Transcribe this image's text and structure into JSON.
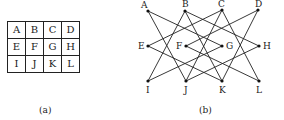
{
  "figure_a": {
    "caption": "(a)",
    "rows": [
      [
        "A",
        "B",
        "C",
        "D"
      ],
      [
        "E",
        "F",
        "G",
        "H"
      ],
      [
        "I",
        "J",
        "K",
        "L"
      ]
    ]
  },
  "figure_b": {
    "caption": "(b)",
    "nodes": {
      "A": {
        "x": 148,
        "y": 11,
        "lx": 141,
        "ly": 8
      },
      "B": {
        "x": 185,
        "y": 11,
        "lx": 182,
        "ly": 7
      },
      "C": {
        "x": 222,
        "y": 10,
        "lx": 218,
        "ly": 7
      },
      "D": {
        "x": 258,
        "y": 10,
        "lx": 255,
        "ly": 7
      },
      "E": {
        "x": 148,
        "y": 46,
        "lx": 138,
        "ly": 49
      },
      "F": {
        "x": 186,
        "y": 46,
        "lx": 176,
        "ly": 49
      },
      "G": {
        "x": 222,
        "y": 46,
        "lx": 226,
        "ly": 49
      },
      "H": {
        "x": 259,
        "y": 46,
        "lx": 263,
        "ly": 49
      },
      "I": {
        "x": 148,
        "y": 81,
        "lx": 146,
        "ly": 93
      },
      "J": {
        "x": 186,
        "y": 81,
        "lx": 184,
        "ly": 93
      },
      "K": {
        "x": 222,
        "y": 81,
        "lx": 219,
        "ly": 93
      },
      "L": {
        "x": 259,
        "y": 81,
        "lx": 256,
        "ly": 93
      }
    },
    "edges": [
      [
        "A",
        "G"
      ],
      [
        "A",
        "J"
      ],
      [
        "B",
        "H"
      ],
      [
        "B",
        "I"
      ],
      [
        "B",
        "K"
      ],
      [
        "C",
        "E"
      ],
      [
        "C",
        "J"
      ],
      [
        "C",
        "L"
      ],
      [
        "D",
        "F"
      ],
      [
        "D",
        "K"
      ],
      [
        "E",
        "K"
      ],
      [
        "F",
        "L"
      ],
      [
        "G",
        "I"
      ],
      [
        "H",
        "J"
      ]
    ]
  }
}
